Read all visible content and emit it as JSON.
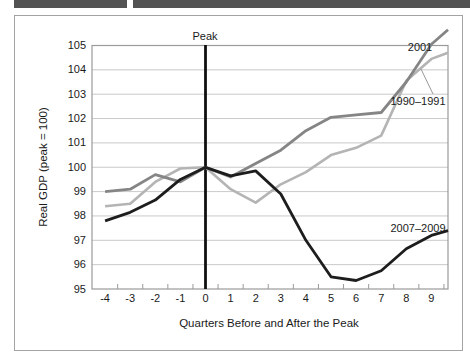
{
  "colors": {
    "header_bar": "#535353",
    "frame_border": "#a3a3a3",
    "plot_frame": "#9a9a9a",
    "gridline": "#c9c9c9",
    "tick": "#9a9a9a",
    "peak_line": "#101010",
    "text": "#1a1a1a",
    "leader_line": "#999999"
  },
  "chart_data": {
    "type": "line",
    "xlabel": "Quarters Before and After the Peak",
    "ylabel": "Real GDP (peak = 100)",
    "peak_label": "Peak",
    "x": [
      -4,
      -3,
      -2,
      -1,
      0,
      1,
      2,
      3,
      4,
      5,
      6,
      7,
      8,
      9
    ],
    "xticklabels": [
      "-4",
      "-3",
      "-2",
      "-1",
      "0",
      "1",
      "2",
      "3",
      "4",
      "5",
      "6",
      "7",
      "8",
      "9"
    ],
    "yticks": [
      95,
      96,
      97,
      98,
      99,
      100,
      101,
      102,
      103,
      104,
      105
    ],
    "ylim": [
      95,
      105
    ],
    "grid": true,
    "legend_position": "inline-labels",
    "peak_line_x": 0,
    "series": [
      {
        "name": "2001",
        "color": "#858585",
        "width": 2.8,
        "values": [
          99.0,
          99.1,
          99.7,
          99.4,
          100.0,
          99.6,
          100.15,
          100.7,
          101.5,
          102.05,
          102.15,
          102.25,
          103.5,
          105.05
        ],
        "edge_value": 105.65
      },
      {
        "name": "1990–1991",
        "color": "#b4b4b4",
        "width": 2.6,
        "values": [
          98.4,
          98.5,
          99.4,
          99.95,
          100.0,
          99.1,
          98.55,
          99.3,
          99.8,
          100.5,
          100.8,
          101.3,
          103.55,
          104.45
        ],
        "edge_value": 104.7
      },
      {
        "name": "2007–2009",
        "color": "#1d1d1d",
        "width": 2.8,
        "values": [
          97.8,
          98.15,
          98.65,
          99.5,
          100.0,
          99.65,
          99.85,
          98.9,
          97.0,
          95.5,
          95.35,
          95.75,
          96.65,
          97.2
        ],
        "edge_value": 97.4
      }
    ]
  }
}
